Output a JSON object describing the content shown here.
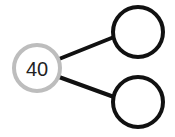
{
  "diagram": {
    "type": "number-bond",
    "colors": {
      "whole_stroke": "#bdbdbd",
      "part_stroke": "#111111",
      "connector": "#111111",
      "label": "#222222",
      "background": "#ffffff"
    },
    "whole": {
      "value": "40",
      "cx": 37,
      "cy": 68,
      "r": 23
    },
    "parts": [
      {
        "value": "",
        "cx": 138,
        "cy": 32,
        "r": 25
      },
      {
        "value": "",
        "cx": 138,
        "cy": 102,
        "r": 25
      }
    ],
    "connectors": [
      {
        "x1": 59,
        "y1": 59,
        "x2": 114,
        "y2": 37
      },
      {
        "x1": 59,
        "y1": 77,
        "x2": 114,
        "y2": 97
      }
    ]
  }
}
